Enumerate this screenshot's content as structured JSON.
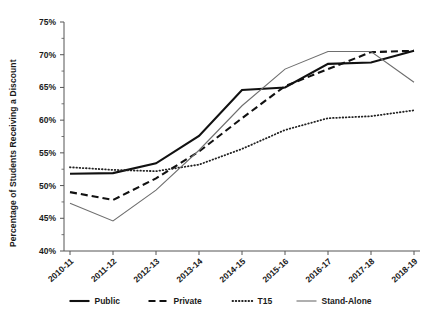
{
  "chart_data": {
    "type": "line",
    "title": "",
    "xlabel": "",
    "ylabel": "Percentage of Students Receiving a Discount",
    "categories": [
      "2010-11",
      "2011-12",
      "2012-13",
      "2013-14",
      "2014-15",
      "2015-16",
      "2016-17",
      "2017-18",
      "2018-19"
    ],
    "ylim": [
      40,
      75
    ],
    "yticks": [
      40,
      45,
      50,
      55,
      60,
      65,
      70,
      75
    ],
    "ytick_labels": [
      "40%",
      "45%",
      "50%",
      "55%",
      "60%",
      "65%",
      "70%",
      "75%"
    ],
    "grid": false,
    "legend_position": "bottom",
    "series": [
      {
        "name": "Public",
        "style": "solid-bold",
        "color": "#111111",
        "values": [
          51.8,
          51.9,
          53.4,
          57.6,
          64.6,
          65.0,
          68.6,
          68.8,
          70.6
        ]
      },
      {
        "name": "Private",
        "style": "dashed",
        "color": "#111111",
        "values": [
          49.0,
          47.8,
          51.1,
          55.2,
          60.3,
          65.2,
          67.8,
          70.4,
          70.6
        ]
      },
      {
        "name": "T15",
        "style": "dotted",
        "color": "#222222",
        "values": [
          52.8,
          52.4,
          52.2,
          53.2,
          55.6,
          58.5,
          60.3,
          60.6,
          61.5
        ]
      },
      {
        "name": "Stand-Alone",
        "style": "solid-thin",
        "color": "#6e6e6e",
        "values": [
          47.3,
          44.6,
          49.3,
          55.4,
          62.2,
          67.8,
          70.5,
          70.5,
          65.8
        ]
      }
    ]
  },
  "legend": {
    "items": [
      {
        "label": "Public",
        "style": "solid-bold"
      },
      {
        "label": "Private",
        "style": "dashed"
      },
      {
        "label": "T15",
        "style": "dotted"
      },
      {
        "label": "Stand-Alone",
        "style": "solid-thin"
      }
    ]
  },
  "axes": {
    "y_title": "Percentage of Students Receiving a Discount"
  }
}
